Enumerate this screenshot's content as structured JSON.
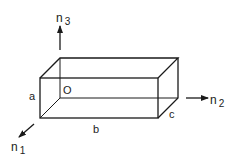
{
  "diagram": {
    "type": "rectangular-box-axes",
    "colors": {
      "stroke": "#1a1a1a",
      "background": "#ffffff"
    },
    "labels": {
      "origin": "O",
      "edge_a": "a",
      "edge_b": "b",
      "edge_c": "c"
    },
    "axes": [
      {
        "name": "n",
        "sub": "3",
        "direction": "up"
      },
      {
        "name": "n",
        "sub": "2",
        "direction": "right"
      },
      {
        "name": "n",
        "sub": "1",
        "direction": "front-left"
      }
    ]
  }
}
